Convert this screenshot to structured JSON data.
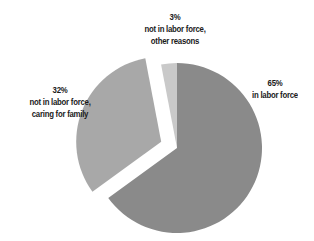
{
  "chart_data": {
    "type": "pie",
    "title": "",
    "start_angle_deg": 90,
    "direction": "clockwise",
    "slices": [
      {
        "label": "in labor force",
        "value": 65,
        "display": "65%",
        "color": "#8a8a8a",
        "exploded": false
      },
      {
        "label": "not in labor force, caring for family",
        "value": 32,
        "display": "32%",
        "color": "#a8a8a8",
        "exploded": true
      },
      {
        "label": "not in labor force, other reasons",
        "value": 3,
        "display": "3%",
        "color": "#c9c9c9",
        "exploded": false
      }
    ],
    "legend": "none (direct labels)"
  },
  "labels": {
    "other": {
      "pct": "3%",
      "line1": "not in labor force,",
      "line2": "other reasons"
    },
    "family": {
      "pct": "32%",
      "line1": "not in labor force,",
      "line2": "caring for family"
    },
    "labor": {
      "pct": "65%",
      "line1": "in labor force"
    }
  }
}
